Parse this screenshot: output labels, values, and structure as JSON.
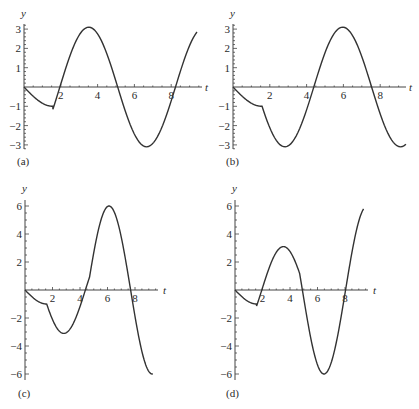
{
  "figure": {
    "line_color": "#333333",
    "axis_color": "#444444"
  },
  "chart_data": [
    {
      "id": "a",
      "type": "line",
      "panel_label": "(a)",
      "xlabel": "t",
      "ylabel": "y",
      "x_ticks": [
        2,
        4,
        6,
        8
      ],
      "x_tick_labels": [
        "2",
        "4",
        "6",
        "8"
      ],
      "y_ticks": [
        3,
        2,
        1,
        -1,
        -2,
        -3
      ],
      "y_tick_labels": [
        "3",
        "2",
        "1",
        "−1",
        "−2",
        "−3"
      ],
      "xlim": [
        0,
        9.5
      ],
      "ylim": [
        -3.2,
        3.2
      ],
      "grid": false,
      "pieces": [
        {
          "t0": 0,
          "t1": 1.57,
          "kind": "negsin",
          "A": 1,
          "phase": 0
        },
        {
          "t0": 1.57,
          "t1": 9.4,
          "kind": "sin",
          "A": 3.1,
          "phase": 1.95
        }
      ],
      "key_points": {
        "t": [
          0,
          1.57,
          2.0,
          3.5,
          5.1,
          6.65,
          8.2,
          9.4
        ],
        "y": [
          0,
          -1,
          0,
          3.1,
          0,
          -3.1,
          0,
          3.0
        ]
      }
    },
    {
      "id": "b",
      "type": "line",
      "panel_label": "(b)",
      "xlabel": "t",
      "ylabel": "y",
      "x_ticks": [
        2,
        4,
        6,
        8
      ],
      "x_tick_labels": [
        "2",
        "4",
        "6",
        "8"
      ],
      "y_ticks": [
        3,
        2,
        1,
        -1,
        -2,
        -3
      ],
      "y_tick_labels": [
        "3",
        "2",
        "1",
        "−1",
        "−2",
        "−3"
      ],
      "xlim": [
        0,
        9.5
      ],
      "ylim": [
        -3.2,
        3.2
      ],
      "grid": false,
      "pieces": [
        {
          "t0": 0,
          "t1": 1.57,
          "kind": "negsin",
          "A": 1,
          "phase": 0
        },
        {
          "t0": 1.57,
          "t1": 9.4,
          "kind": "negsin",
          "A": 3.1,
          "phase": 1.25
        }
      ],
      "key_points": {
        "t": [
          0,
          1.57,
          2.8,
          4.4,
          5.95,
          7.5,
          9.1,
          9.4
        ],
        "y": [
          0,
          -1,
          -3.1,
          0,
          3.1,
          0,
          -3.1,
          -3.0
        ]
      }
    },
    {
      "id": "c",
      "type": "line",
      "panel_label": "(c)",
      "xlabel": "t",
      "ylabel": "y",
      "x_ticks": [
        2,
        4,
        6,
        8
      ],
      "x_tick_labels": [
        "2",
        "4",
        "6",
        "8"
      ],
      "y_ticks": [
        6,
        4,
        2,
        -2,
        -4,
        -6
      ],
      "y_tick_labels": [
        "6",
        "4",
        "2",
        "−2",
        "−4",
        "−6"
      ],
      "xlim": [
        0,
        9.5
      ],
      "ylim": [
        -6.2,
        6.2
      ],
      "grid": false,
      "pieces": [
        {
          "t0": 0,
          "t1": 1.57,
          "kind": "negsin",
          "A": 1,
          "phase": 0
        },
        {
          "t0": 1.57,
          "t1": 4.7,
          "kind": "negsin",
          "A": 3.1,
          "phase": 1.25
        },
        {
          "t0": 4.7,
          "t1": 9.3,
          "kind": "sin",
          "A": 6,
          "phase": 4.54
        }
      ],
      "key_points": {
        "t": [
          0,
          1.57,
          2.8,
          4.4,
          4.7,
          6.1,
          7.7,
          9.3
        ],
        "y": [
          0,
          -1,
          -3.1,
          0,
          1,
          6,
          0,
          -6
        ]
      }
    },
    {
      "id": "d",
      "type": "line",
      "panel_label": "(d)",
      "xlabel": "t",
      "ylabel": "y",
      "x_ticks": [
        2,
        4,
        6,
        8
      ],
      "x_tick_labels": [
        "2",
        "4",
        "6",
        "8"
      ],
      "y_ticks": [
        6,
        4,
        2,
        -2,
        -4,
        -6
      ],
      "y_tick_labels": [
        "6",
        "4",
        "2",
        "−2",
        "−4",
        "−6"
      ],
      "xlim": [
        0,
        9.5
      ],
      "ylim": [
        -6.2,
        6.2
      ],
      "grid": false,
      "pieces": [
        {
          "t0": 0,
          "t1": 1.57,
          "kind": "negsin",
          "A": 1,
          "phase": 0
        },
        {
          "t0": 1.57,
          "t1": 4.7,
          "kind": "sin",
          "A": 3.1,
          "phase": 1.95
        },
        {
          "t0": 4.7,
          "t1": 9.35,
          "kind": "negsin",
          "A": 6,
          "phase": 4.9
        }
      ],
      "key_points": {
        "t": [
          0,
          1.57,
          2.0,
          3.5,
          4.7,
          6.45,
          8.0,
          9.35
        ],
        "y": [
          0,
          -1,
          0,
          3.1,
          1.2,
          -6,
          0,
          6
        ]
      }
    }
  ],
  "layout": {
    "panels": [
      {
        "id": "a",
        "origin_x": 24,
        "origin_y": 87,
        "px_per_t": 18.4,
        "px_per_y": 19.3,
        "axis_top_y": 24,
        "axis_bottom_y": 149,
        "axis_end_x": 202,
        "label_x": 17,
        "label_y": 165,
        "ylabel_x": 21,
        "ylabel_y": 17,
        "tlabel_x": 205,
        "tlabel_y": 91
      },
      {
        "id": "b",
        "origin_x": 233,
        "origin_y": 87,
        "px_per_t": 18.4,
        "px_per_y": 19.3,
        "axis_top_y": 24,
        "axis_bottom_y": 149,
        "axis_end_x": 406,
        "label_x": 226,
        "label_y": 165,
        "ylabel_x": 230,
        "ylabel_y": 17,
        "tlabel_x": 409,
        "tlabel_y": 91
      },
      {
        "id": "c",
        "origin_x": 25,
        "origin_y": 290,
        "px_per_t": 13.75,
        "px_per_y": 14.0,
        "axis_top_y": 200,
        "axis_bottom_y": 380,
        "axis_end_x": 158,
        "label_x": 18,
        "label_y": 397,
        "ylabel_x": 22,
        "ylabel_y": 192,
        "tlabel_x": 163,
        "tlabel_y": 294
      },
      {
        "id": "d",
        "origin_x": 235,
        "origin_y": 290,
        "px_per_t": 13.75,
        "px_per_y": 14.0,
        "axis_top_y": 200,
        "axis_bottom_y": 380,
        "axis_end_x": 368,
        "label_x": 226,
        "label_y": 397,
        "ylabel_x": 232,
        "ylabel_y": 192,
        "tlabel_x": 373,
        "tlabel_y": 294
      }
    ]
  }
}
